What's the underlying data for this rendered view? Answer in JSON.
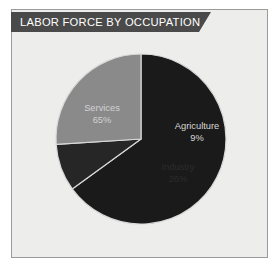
{
  "title": "LABOR FORCE BY OCCUPATION",
  "colors": {
    "page_background": "#ffffff",
    "panel_background": "#ededec",
    "panel_border": "#9a9a9a",
    "ribbon": "#4a4a4a",
    "services_slice": "#1a1a1a",
    "agriculture_slice": "#262626",
    "industry_slice": "#8a8a8a",
    "slice_divider": "#d8d8d8",
    "light_label_text": "#d4d4d4",
    "dark_label_text": "#2c2c2c"
  },
  "chart_data": {
    "type": "pie",
    "title": "LABOR FORCE BY OCCUPATION",
    "xlabel": "",
    "ylabel": "",
    "legend_position": "none",
    "labels_inside_slices": true,
    "start_angle_deg": 0,
    "direction": "clockwise",
    "categories": [
      "Services",
      "Agriculture",
      "Industry"
    ],
    "values": [
      65,
      9,
      26
    ],
    "unit": "%",
    "slices": [
      {
        "name": "Services",
        "value": 65,
        "display_value": "65%",
        "color": "#1a1a1a",
        "label_color": "#d2d2d2"
      },
      {
        "name": "Agriculture",
        "value": 9,
        "display_value": "9%",
        "color": "#262626",
        "label_color": "#d8d8d8"
      },
      {
        "name": "Industry",
        "value": 26,
        "display_value": "26%",
        "color": "#8a8a8a",
        "label_color": "#2c2c2c"
      }
    ]
  }
}
